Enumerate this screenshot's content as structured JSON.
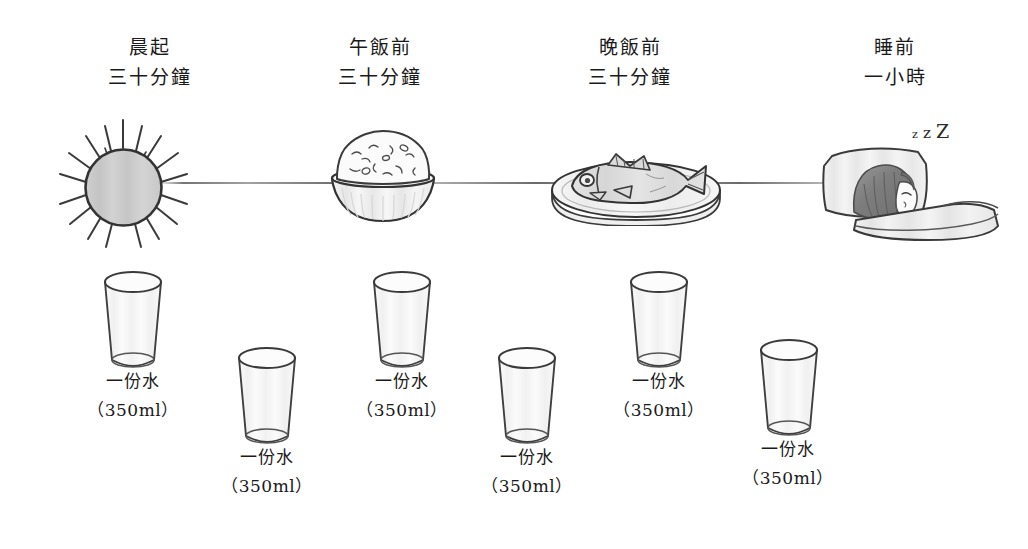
{
  "illustration": {
    "title": "Daily Water Drinking Schedule (hand-drawn infographic)",
    "background_color": "#ffffff",
    "ink_color": "#333333"
  },
  "timeline": {
    "name": "daily-timeline",
    "color": "#555555"
  },
  "stages": [
    {
      "id": "morning-wake",
      "line1": "晨起",
      "line2": "三十分鐘",
      "icon": "sun-icon"
    },
    {
      "id": "before-lunch",
      "line1": "午飯前",
      "line2": "三十分鐘",
      "icon": "rice-bowl-icon"
    },
    {
      "id": "before-dinner",
      "line1": "晚飯前",
      "line2": "三十分鐘",
      "icon": "fish-plate-icon"
    },
    {
      "id": "before-sleep",
      "line1": "睡前",
      "line2": "一小時",
      "icon": "sleeping-person-icon"
    }
  ],
  "water_portions": [
    {
      "id": "portion-1",
      "label": "一份水",
      "amount": "（350ml）"
    },
    {
      "id": "portion-2",
      "label": "一份水",
      "amount": "（350ml）"
    },
    {
      "id": "portion-3",
      "label": "一份水",
      "amount": "（350ml）"
    },
    {
      "id": "portion-4",
      "label": "一份水",
      "amount": "（350ml）"
    },
    {
      "id": "portion-5",
      "label": "一份水",
      "amount": "（350ml）"
    },
    {
      "id": "portion-6",
      "label": "一份水",
      "amount": "（350ml）"
    }
  ],
  "sleep_marks": {
    "z_small": "z",
    "z_mid": "z",
    "z_large": "Z"
  }
}
